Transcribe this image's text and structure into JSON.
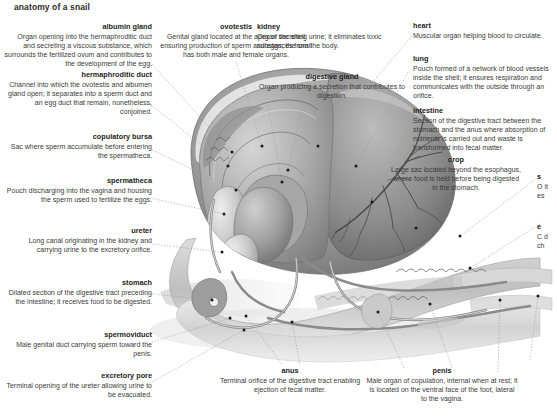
{
  "title": "anatomy of a snail",
  "colors": {
    "background": "#ffffff",
    "term_text": "#1d1d1d",
    "body_text": "#3a3a3a",
    "leader_line": "#9a9a9a",
    "marker_dot": "#1a1a1a",
    "art_dark": "#5d5d5d",
    "art_mid": "#9c9c9c",
    "art_light": "#d8d8d8"
  },
  "labels": {
    "albumin_gland": {
      "term": "albumin gland",
      "desc": "Organ opening into the hermaphroditic duct and secreting a viscous substance, which surrounds the fertilized ovum and contributes to the development of the egg."
    },
    "hermaphroditic_duct": {
      "term": "hermaphroditic duct",
      "desc": "Channel into which the ovotestis and albumen gland open; it separates into a sperm duct and an egg duct that remain, nonetheless, conjoined."
    },
    "copulatory_bursa": {
      "term": "copulatory bursa",
      "desc": "Sac where sperm accumulate before entering the spermatheca."
    },
    "spermatheca": {
      "term": "spermatheca",
      "desc": "Pouch discharging into the vagina and housing the sperm used to fertilize the eggs."
    },
    "ureter": {
      "term": "ureter",
      "desc": "Long canal originating in the kidney and carrying urine to the excretory orifice."
    },
    "stomach": {
      "term": "stomach",
      "desc": "Dilated section of the digestive tract preceding the intestine; it receives food to be digested."
    },
    "spermoviduct": {
      "term": "spermoviduct",
      "desc": "Male genital duct carrying sperm toward the penis."
    },
    "excretory_pore": {
      "term": "excretory pore",
      "desc": "Terminal opening of the ureter allowing urine to be evacuated."
    },
    "ovotestis": {
      "term": "ovotestis",
      "desc": "Genital gland located at the apex of the shell ensuring production of sperm and eggs; the snail has both male and female organs."
    },
    "kidney": {
      "term": "kidney",
      "desc": "Organ secreting urine; it eliminates toxic substances from the body."
    },
    "digestive_gland": {
      "term": "digestive gland",
      "desc": "Organ producing a secretion that contributes to digestion."
    },
    "heart": {
      "term": "heart",
      "desc": "Muscular organ helping blood to circulate."
    },
    "lung": {
      "term": "lung",
      "desc": "Pouch formed of a network of blood vessels inside the shell; it ensures respiration and communicates with the outside through an orifice."
    },
    "intestine": {
      "term": "intestine",
      "desc": "Section of the digestive tract between the stomach and the anus where absorption of nutrients is carried out and waste is transformed into fecal matter."
    },
    "crop": {
      "term": "crop",
      "desc": "Large sac located beyond the esophagus, where food is held before being digested in the stomach."
    },
    "anus": {
      "term": "anus",
      "desc": "Terminal orifice of the digestive tract enabling ejection of fecal matter."
    },
    "penis": {
      "term": "penis",
      "desc": "Male organ of copulation, internal when at rest; it is located on the ventral face of the foot, lateral to the vagina."
    },
    "clipped_right_upper": {
      "term": "s",
      "desc": "O it es"
    },
    "clipped_right_lower": {
      "term": "e",
      "desc": "C d ch"
    }
  }
}
